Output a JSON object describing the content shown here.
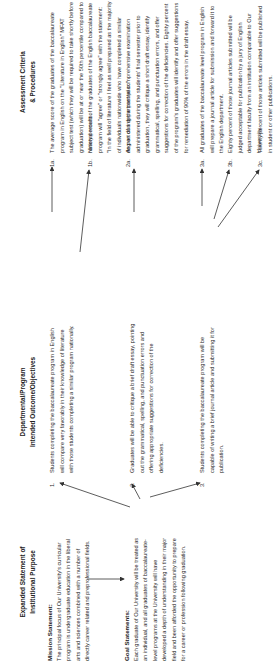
{
  "columns": {
    "purpose": {
      "heading_line1": "Expanded Statement of",
      "heading_line2": "Institutional Purpose",
      "mission": {
        "label": "Mission Statement:",
        "text": "The principal focus of Our University's curricular program is undergraduate education in the liberal arts and sciences combined with a number of directly career related and preprofessional fields."
      },
      "goal": {
        "label": "Goal Statements:",
        "text": "Each graduate of Our University will be treated as an individual, and all graduates of baccalaureate-level programs at the University will have developed a depth of understanding in their major field and been afforded the opportunity to prepare for a career or profession following graduation."
      }
    },
    "objectives": {
      "heading_line1": "Departmental/Program",
      "heading_line2": "Intended Outcome/Objectives",
      "items": [
        {
          "num": "1.",
          "text": "Students completing the baccalaureate program in English will compare very favorably in their knowledge of literature with those students completing a similar program nationally."
        },
        {
          "num": "2.",
          "text": "Graduates will be able to critique a brief draft essay, pointing out the grammatical, spelling, and punctuation errors and offering appropriate suggestions for correction of the deficiencies."
        },
        {
          "num": "3.",
          "text": "Students completing the baccalaureate program will be capable of writing a brief journal article and submitting it for publication."
        }
      ]
    },
    "assessment": {
      "heading_line1": "Assessment Criteria",
      "heading_line2": "& Procedures",
      "items": [
        {
          "num": "1a.",
          "text": "The average score of the graduates of the baccalaureate program in English on the \"Literature in English\" MFAT subject test (which they will be required to take shortly before graduation) will be at or near the 50th percentile compared to national results."
        },
        {
          "num": "1b.",
          "text": "Ninety percent of the graduates of the English baccalaureate program will \"agree\" or \"strongly agree\" with the statement: \"In the field of literature I feel as well prepared as the majority of individuals nationwide who have completed a similar degree during the past year.\""
        },
        {
          "num": "2a.",
          "text": "As part of a departmental comprehensive examination administered during the students' final semester prior to graduation, they will critique a short draft essay, identify grammatical, spelling, and punctuation errors, and offer suggestions for correction of the deficiencies. Eighty percent of the program's graduates will identify and offer suggestions for remediation of 90% of the errors in the draft essay."
        },
        {
          "num": "3a.",
          "text": "All graduates of the baccalaureate level program in English will prepare a journal article for submission and forward it to the English department."
        },
        {
          "num": "3b.",
          "text": "Eighty percent of those journal articles submitted will be judged acceptable for publication by a jury of English department faculty from an institution comparable to Our University."
        },
        {
          "num": "3c.",
          "text": "Twenty percent of those articles submitted will be published in student or other publications."
        }
      ]
    }
  },
  "colors": {
    "text": "#2a2a2a",
    "arrow": "#333333",
    "background": "#ffffff"
  }
}
